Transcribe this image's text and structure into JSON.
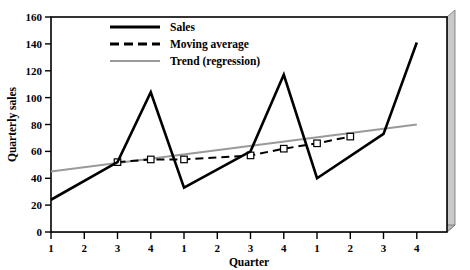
{
  "chart_data": {
    "type": "line",
    "title": "",
    "xlabel": "Quarter",
    "ylabel": "Quarterly sales",
    "ylim": [
      0,
      160
    ],
    "ytick_step": 20,
    "yticks": [
      0,
      20,
      40,
      60,
      80,
      100,
      120,
      140,
      160
    ],
    "x": [
      1,
      2,
      3,
      4,
      5,
      6,
      7,
      8,
      9,
      10,
      11,
      12
    ],
    "categories": [
      "1",
      "2",
      "3",
      "4",
      "1",
      "2",
      "3",
      "4",
      "1",
      "2",
      "3",
      "4"
    ],
    "grid": false,
    "legend_position": "top-center",
    "series": [
      {
        "name": "Sales",
        "style": "solid",
        "color": "#000000",
        "width": 2.6,
        "marker": "none",
        "x": [
          1,
          3,
          4,
          5,
          7,
          8,
          9,
          11,
          12
        ],
        "values": [
          24,
          52,
          104,
          33,
          60,
          117,
          40,
          73,
          141
        ]
      },
      {
        "name": "Moving average",
        "style": "dashed",
        "color": "#000000",
        "width": 2.0,
        "marker": "square",
        "x": [
          3,
          4,
          5,
          7,
          8,
          9,
          10
        ],
        "values": [
          52,
          54,
          54,
          57,
          62,
          66,
          71
        ]
      },
      {
        "name": "Trend (regression)",
        "style": "solid",
        "color": "#9a9a9a",
        "width": 2.2,
        "marker": "none",
        "x": [
          1,
          12
        ],
        "values": [
          45,
          80
        ]
      }
    ]
  },
  "legend": {
    "items": [
      {
        "label": "Sales",
        "key": "sales"
      },
      {
        "label": "Moving average",
        "key": "moving-average"
      },
      {
        "label": "Trend (regression)",
        "key": "trend-regression"
      }
    ]
  },
  "axes": {
    "x_title": "Quarter",
    "y_title": "Quarterly sales",
    "y_labels": [
      "160",
      "140",
      "120",
      "100",
      "80",
      "60",
      "40",
      "20",
      "0"
    ],
    "x_labels": [
      "1",
      "2",
      "3",
      "4",
      "1",
      "2",
      "3",
      "4",
      "1",
      "2",
      "3",
      "4"
    ]
  },
  "colors": {
    "sales": "#000000",
    "moving_average": "#000000",
    "trend": "#9a9a9a",
    "frame": "#000000",
    "bevel": "#b0b0b0",
    "background": "#ffffff"
  }
}
